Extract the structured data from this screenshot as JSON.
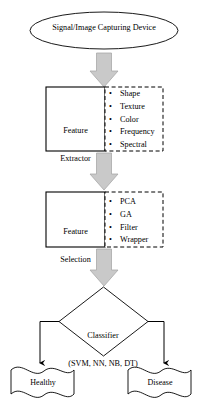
{
  "diagram": {
    "colors": {
      "stroke": "#000000",
      "arrow_fill": "#c9c9c9",
      "arrow_stroke": "#a8a8a8",
      "background": "#ffffff"
    },
    "nodes": {
      "source": {
        "shape": "ellipse",
        "label": "Signal/Image Capturing Device"
      },
      "feature_extractor": {
        "shape": "rectangle",
        "label_line1": "Feature",
        "label_line2": "Extractor",
        "label": "Feature Extractor"
      },
      "feature_extractor_options": {
        "shape": "dashed-rectangle",
        "bullet": "•",
        "items": [
          "Shape",
          "Texture",
          "Color",
          "Frequency",
          "Spectral"
        ]
      },
      "feature_selection": {
        "shape": "rectangle",
        "label_line1": "Feature",
        "label_line2": "Selection",
        "label": "Feature Selection"
      },
      "feature_selection_options": {
        "shape": "dashed-rectangle",
        "bullet": "•",
        "items": [
          "PCA",
          "GA",
          "Filter",
          "Wrapper"
        ]
      },
      "classifier": {
        "shape": "diamond",
        "label_line1": "Classifier",
        "label_line2": "(SVM, NN, NB, DT)",
        "label": "Classifier (SVM, NN, NB, DT)"
      },
      "outcome_healthy": {
        "shape": "wavy-banner",
        "label": "Healthy"
      },
      "outcome_disease": {
        "shape": "wavy-banner",
        "label": "Disease"
      }
    },
    "connectors": [
      {
        "name": "source-to-extractor",
        "style": "block-arrow",
        "direction": "down"
      },
      {
        "name": "extractor-to-selection",
        "style": "block-arrow",
        "direction": "down"
      },
      {
        "name": "selection-to-classifier",
        "style": "block-arrow",
        "direction": "down"
      },
      {
        "name": "classifier-to-healthy",
        "style": "line-arrow",
        "direction": "left-down"
      },
      {
        "name": "classifier-to-disease",
        "style": "line-arrow",
        "direction": "right-down"
      }
    ]
  }
}
